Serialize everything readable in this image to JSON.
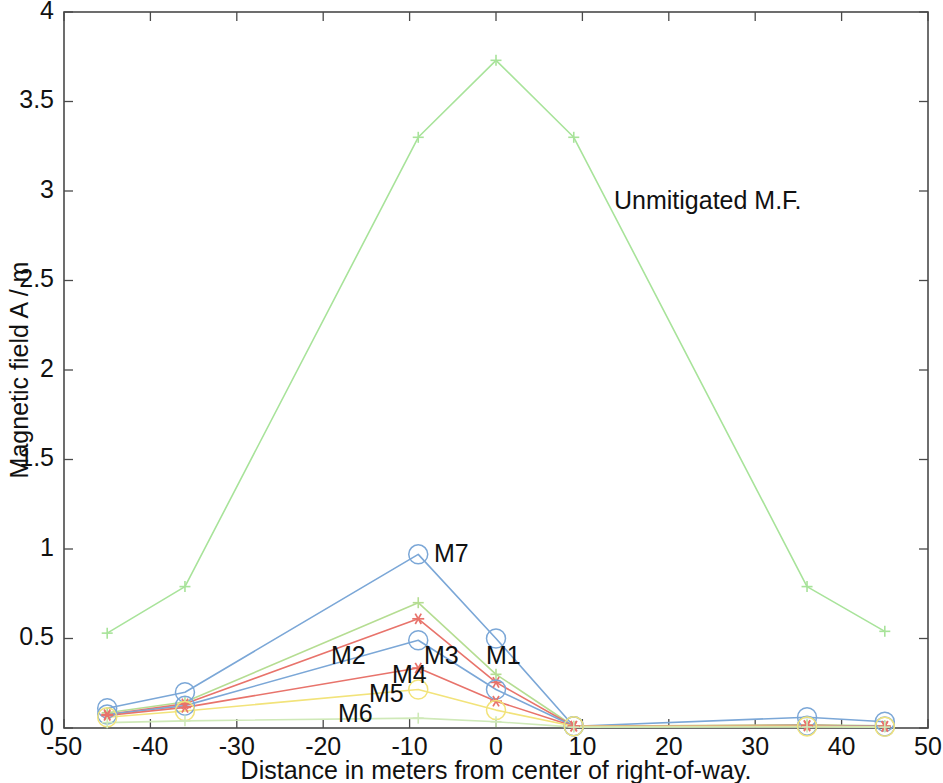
{
  "chart_data": {
    "type": "line",
    "title": "",
    "xlabel": "Distance in meters from center of right-of-way.",
    "ylabel": "Magnetic field A / m",
    "xlim": [
      -50,
      50
    ],
    "ylim": [
      0,
      4
    ],
    "xticks": [
      -50,
      -40,
      -30,
      -20,
      -10,
      0,
      10,
      20,
      30,
      40,
      50
    ],
    "xticklabels": [
      "-50",
      "-40",
      "-30",
      "-20",
      "-10",
      "0",
      "10",
      "20",
      "30",
      "40",
      "50"
    ],
    "yticks": [
      0,
      0.5,
      1,
      1.5,
      2,
      2.5,
      3,
      3.5,
      4
    ],
    "yticklabels": [
      "0",
      "0.5",
      "1",
      "1.5",
      "2",
      "2.5",
      "3",
      "3.5",
      "4"
    ],
    "grid": false,
    "legend_position": "inline-annotations",
    "x": [
      -45,
      -36,
      -9,
      0,
      9,
      36,
      45
    ],
    "series": [
      {
        "name": "Unmitigated M.F.",
        "label": "Unmitigated M.F.",
        "color": "#a8e39a",
        "marker": "plus",
        "values": [
          0.53,
          0.79,
          3.3,
          3.73,
          3.3,
          0.79,
          0.54
        ]
      },
      {
        "name": "M7",
        "label": "M7",
        "color": "#7ba7d7",
        "marker": "circle",
        "values": [
          0.11,
          0.2,
          0.97,
          0.5,
          0.01,
          0.06,
          0.035
        ]
      },
      {
        "name": "M2",
        "label": "M2",
        "color": "#b5dd92",
        "marker": "plus",
        "values": [
          0.085,
          0.145,
          0.7,
          0.3,
          0.01,
          0.018,
          0.012
        ]
      },
      {
        "name": "M4",
        "label": "M4",
        "color": "#e8736b",
        "marker": "star",
        "values": [
          0.075,
          0.135,
          0.61,
          0.255,
          0.01,
          0.015,
          0.01
        ]
      },
      {
        "name": "M3",
        "label": "M3",
        "color": "#7ba7d7",
        "marker": "circle",
        "values": [
          0.075,
          0.125,
          0.49,
          0.215,
          0.01,
          0.013,
          0.009
        ]
      },
      {
        "name": "M1",
        "label": "M1",
        "color": "#e8736b",
        "marker": "star",
        "values": [
          0.07,
          0.115,
          0.335,
          0.15,
          0.01,
          0.011,
          0.008
        ]
      },
      {
        "name": "M5",
        "label": "M5",
        "color": "#f2e37a",
        "marker": "circle",
        "values": [
          0.06,
          0.095,
          0.215,
          0.1,
          0.01,
          0.009,
          0.007
        ]
      },
      {
        "name": "M6",
        "label": "M6",
        "color": "#cfe9b8",
        "marker": "plus",
        "values": [
          0.03,
          0.04,
          0.055,
          0.035,
          0.005,
          0.006,
          0.005
        ]
      }
    ],
    "annotations": [
      {
        "name": "unmitigated-label",
        "text": "Unmitigated M.F.",
        "x_px": 614,
        "y_px": 209
      },
      {
        "name": "m7-label",
        "text": "M7",
        "x_px": 434,
        "y_px": 562
      },
      {
        "name": "m2-label",
        "text": "M2",
        "x_px": 331,
        "y_px": 664
      },
      {
        "name": "m3-label",
        "text": "M3",
        "x_px": 424,
        "y_px": 664
      },
      {
        "name": "m1-label",
        "text": "M1",
        "x_px": 486,
        "y_px": 664
      },
      {
        "name": "m4-label",
        "text": "M4",
        "x_px": 392,
        "y_px": 683
      },
      {
        "name": "m5-label",
        "text": "M5",
        "x_px": 369,
        "y_px": 702
      },
      {
        "name": "m6-label",
        "text": "M6",
        "x_px": 338,
        "y_px": 722
      }
    ]
  },
  "axes": {
    "x_axis_title": "Distance in meters from center of right-of-way.",
    "y_axis_title": "Magnetic field A / m"
  }
}
